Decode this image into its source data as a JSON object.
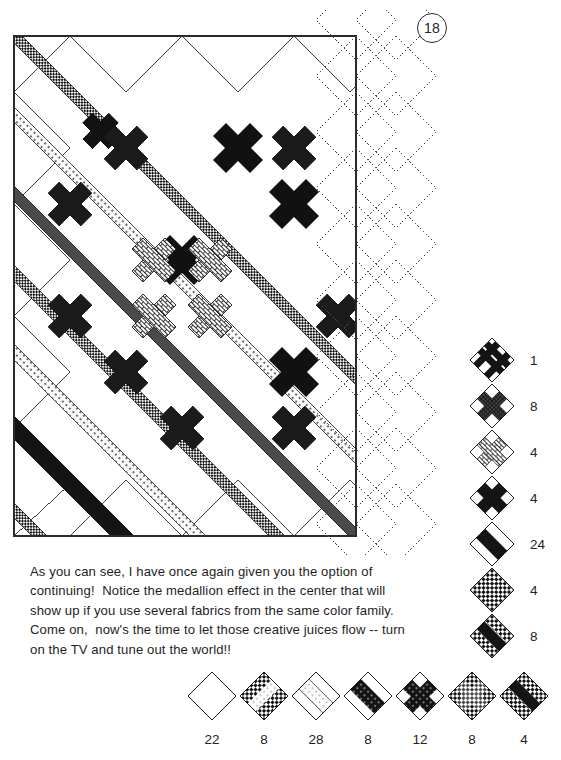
{
  "page": {
    "number": "18"
  },
  "caption": {
    "lines": [
      "As you can see, I have once again given you the option of",
      "continuing!  Notice the medallion effect in the center that will",
      "show up if you use several fabrics from the same color family.",
      "Come on,  now's the time to let those creative juices flow -- turn",
      "on the TV and tune out the world!!"
    ]
  },
  "colors": {
    "ink": "#1a1a1a",
    "dark": "#111111",
    "mid_gray": "#4d4d4d",
    "light_gray": "#b9b9b9",
    "paper": "#ffffff",
    "dotted_outline": "#555555"
  },
  "quilt": {
    "name": "diagonal-lattice-quilt",
    "description": "On-point diagonal lattice quilt top with pieced sashing strips, nine-patch intersections, a central medallion of four brick-print crosses, stippled setting triangles on the left and bottom edges, and dotted outline diamonds on the right edge showing the optional continuation.",
    "grid": {
      "rows": 11,
      "cols": 11
    },
    "bounds": {
      "x": 14,
      "y": 36,
      "width": 342,
      "height": 500
    },
    "continuation_note": "dotted diamonds at right edge"
  },
  "legend_side": {
    "name": "block-key-vertical",
    "items": [
      {
        "id": "block-stripe-9patch",
        "pattern": "black-stripe-nine-patch",
        "count": "1"
      },
      {
        "id": "block-speckle-cross",
        "pattern": "speckled-cross",
        "count": "8"
      },
      {
        "id": "block-brick-cross",
        "pattern": "brick-print-cross",
        "count": "4"
      },
      {
        "id": "block-solid-cross",
        "pattern": "solid-black-cross",
        "count": "4"
      },
      {
        "id": "block-diagonal-band",
        "pattern": "solid-diagonal-band",
        "count": "24"
      },
      {
        "id": "block-checker-grid",
        "pattern": "checkerboard-grid",
        "count": "4"
      },
      {
        "id": "block-band-checker",
        "pattern": "band-with-checkers",
        "count": "8"
      }
    ]
  },
  "legend_bottom": {
    "name": "block-key-horizontal",
    "items": [
      {
        "id": "block-plain",
        "pattern": "plain-white",
        "count": "22"
      },
      {
        "id": "block-dot-checker",
        "pattern": "dotted-checker-band",
        "count": "8"
      },
      {
        "id": "block-striped-band",
        "pattern": "light-striped-band",
        "count": "28"
      },
      {
        "id": "block-black-band",
        "pattern": "black-dotted-band",
        "count": "8"
      },
      {
        "id": "block-dotted-cross",
        "pattern": "black-dotted-cross",
        "count": "12"
      },
      {
        "id": "block-gray-checker",
        "pattern": "gray-checker-cross",
        "count": "8"
      },
      {
        "id": "block-checker-band",
        "pattern": "checker-band",
        "count": "4"
      }
    ]
  }
}
